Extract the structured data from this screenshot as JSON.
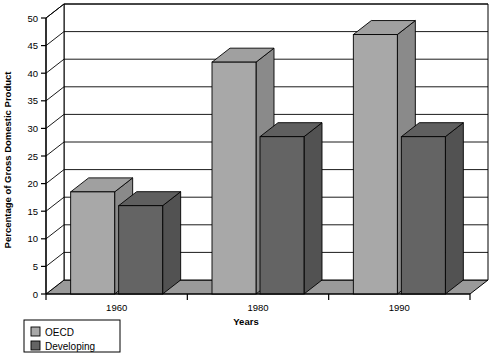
{
  "chart_data": {
    "type": "bar",
    "title": "",
    "subtitle": "",
    "xlabel": "Years",
    "ylabel": "Percentage of Gross Domestic Product",
    "categories": [
      "1960",
      "1980",
      "1990"
    ],
    "series": [
      {
        "name": "OECD",
        "values": [
          18.5,
          42,
          47
        ],
        "color": "#a8a8a8"
      },
      {
        "name": "Developing",
        "values": [
          16,
          28.5,
          28.5
        ],
        "color": "#646464"
      }
    ],
    "ylim": [
      0,
      50
    ],
    "yticks": [
      0,
      5,
      10,
      15,
      20,
      25,
      30,
      35,
      40,
      45,
      50
    ],
    "ytick_labels": [
      "0",
      "5",
      "10",
      "15",
      "20",
      "25",
      "30",
      "35",
      "40",
      "45",
      "50"
    ],
    "grid": true,
    "grid_axis": "y",
    "legend_position": "bottom-left",
    "style": "3d-bar",
    "frame_color": "#000000",
    "background": "#ffffff",
    "floor_color": "#9a9a9a"
  },
  "legend": {
    "entries": [
      {
        "label": "OECD",
        "swatch": "#a8a8a8"
      },
      {
        "label": "Developing",
        "swatch": "#646464"
      }
    ]
  },
  "axes": {
    "y_title": "Percentage of Gross Domestic Product",
    "x_title": "Years"
  }
}
